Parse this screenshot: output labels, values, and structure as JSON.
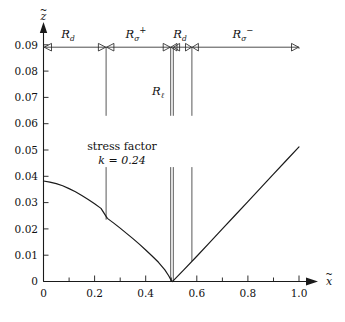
{
  "figure": {
    "title": "",
    "annotation_line1": "stress factor",
    "annotation_line2": "k = 0.24"
  },
  "axes": {
    "x_label": "x",
    "x_label_accent": "~",
    "y_label": "z",
    "y_label_accent": "~",
    "x_ticks": [
      "0",
      "0.2",
      "0.4",
      "0.6",
      "0.8",
      "1.0"
    ],
    "x_tick_values": [
      0,
      0.2,
      0.4,
      0.6,
      0.8,
      1.0
    ],
    "x_minor_values": [
      0.1,
      0.3,
      0.5,
      0.7,
      0.9
    ],
    "y_ticks": [
      "0",
      "0.01",
      "0.02",
      "0.03",
      "0.04",
      "0.05",
      "0.06",
      "0.07",
      "0.08",
      "0.09"
    ],
    "y_tick_values": [
      0,
      0.01,
      0.02,
      0.03,
      0.04,
      0.05,
      0.06,
      0.07,
      0.08,
      0.09
    ],
    "xlim": [
      0,
      1.04
    ],
    "ylim": [
      0,
      0.098
    ]
  },
  "chart_data": {
    "type": "line",
    "title": "",
    "xlabel": "x~",
    "ylabel": "z~",
    "xlim": [
      0,
      1.04
    ],
    "ylim": [
      0,
      0.098
    ],
    "grid": false,
    "legend": "none",
    "annotations": [
      {
        "text": "stress factor",
        "x": 0.3,
        "y": 0.0505
      },
      {
        "text": "k = 0.24",
        "x": 0.3,
        "y": 0.0455
      },
      {
        "text": "R_l",
        "x": 0.455,
        "y": 0.0755
      }
    ],
    "series": [
      {
        "name": "free-surface profile",
        "x": [
          0.0,
          0.025,
          0.05,
          0.075,
          0.1,
          0.125,
          0.15,
          0.175,
          0.2,
          0.225,
          0.25,
          0.275,
          0.3,
          0.325,
          0.35,
          0.375,
          0.4,
          0.425,
          0.45,
          0.475,
          0.49,
          0.5,
          0.505,
          0.51,
          0.55,
          0.6,
          0.65,
          0.7,
          0.75,
          0.8,
          0.85,
          0.9,
          0.95,
          1.0
        ],
        "y": [
          0.0382,
          0.0378,
          0.0372,
          0.0364,
          0.0353,
          0.0341,
          0.0327,
          0.0312,
          0.0296,
          0.0278,
          0.024,
          0.0222,
          0.0203,
          0.0183,
          0.0163,
          0.0142,
          0.012,
          0.0097,
          0.0073,
          0.0044,
          0.0022,
          0.0004,
          0.0,
          0.0005,
          0.0045,
          0.0096,
          0.0148,
          0.02,
          0.0252,
          0.0304,
          0.0356,
          0.0408,
          0.046,
          0.0512
        ]
      }
    ],
    "region_markers": {
      "bar_y": 0.0955,
      "boundaries": [
        0.0,
        0.245,
        0.255,
        0.498,
        0.508,
        0.518,
        0.58,
        1.0
      ],
      "regions": [
        {
          "label": "R_d",
          "base": "R",
          "sub": "d",
          "sup": "",
          "x_start": 0.0,
          "x_end": 0.25
        },
        {
          "label": "R_sigma_plus",
          "base": "R",
          "sub": "σ",
          "sup": "+",
          "x_start": 0.255,
          "x_end": 0.498
        },
        {
          "label": "R_d",
          "base": "R",
          "sub": "d",
          "sup": "",
          "x_start": 0.518,
          "x_end": 0.58
        },
        {
          "label": "R_sigma_minus",
          "base": "R",
          "sub": "σ",
          "sup": "−",
          "x_start": 0.58,
          "x_end": 1.0
        }
      ],
      "drop_lines": [
        {
          "x": 0.245,
          "y_top": 0.0955,
          "y_bottom": 0.063
        },
        {
          "x": 0.245,
          "y_top": 0.0435,
          "y_bottom": 0.0235
        },
        {
          "x": 0.498,
          "y_top": 0.0955,
          "y_bottom": 0.063
        },
        {
          "x": 0.498,
          "y_top": 0.0435,
          "y_bottom": 0.0002
        },
        {
          "x": 0.508,
          "y_top": 0.0955,
          "y_bottom": 0.063
        },
        {
          "x": 0.508,
          "y_top": 0.0435,
          "y_bottom": 0.0002
        },
        {
          "x": 0.58,
          "y_top": 0.0955,
          "y_bottom": 0.063
        },
        {
          "x": 0.58,
          "y_top": 0.0435,
          "y_bottom": 0.0078
        },
        {
          "x": 1.0,
          "y_top": 0.0955,
          "y_bottom": 0.0885
        }
      ]
    }
  }
}
